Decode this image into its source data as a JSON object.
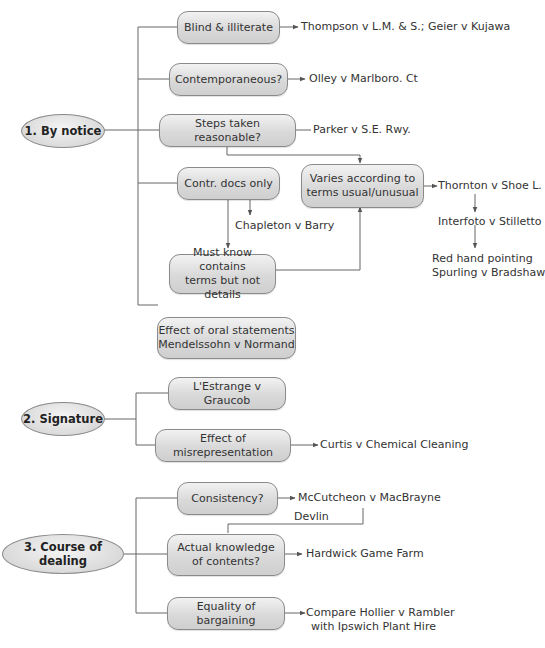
{
  "diagram": {
    "sections": [
      {
        "label": "1. By notice",
        "branches": [
          {
            "label": "Blind & illiterate",
            "case": "Thompson v L.M. & S.; Geier v Kujawa"
          },
          {
            "label": "Contemporaneous?",
            "case": "Olley v Marlboro. Ct"
          },
          {
            "label": "Steps taken reasonable?",
            "case": "Parker v S.E. Rwy."
          },
          {
            "label": "Contr. docs only",
            "case": "Chapleton v Barry"
          },
          {
            "label": "Must know contains terms but not details",
            "line1": "Must know contains",
            "line2": "terms but not details"
          },
          {
            "label": "Effect of oral statements Mendelssohn v Normand",
            "line1": "Effect of oral statements",
            "line2": "Mendelssohn v Normand"
          }
        ],
        "varies": {
          "line1": "Varies according to",
          "line2": "terms usual/unusual"
        },
        "chain": [
          {
            "label": "Thornton v Shoe L."
          },
          {
            "label": "Interfoto v Stilletto"
          },
          {
            "line1": "Red hand pointing",
            "line2": "Spurling v Bradshaw"
          }
        ]
      },
      {
        "label": "2. Signature",
        "branches": [
          {
            "label": "L'Estrange v Graucob"
          },
          {
            "label": "Effect of misrepresentation",
            "case": "Curtis v Chemical Cleaning"
          }
        ]
      },
      {
        "label": "3. Course of dealing",
        "branches": [
          {
            "label": "Consistency?",
            "case": "McCutcheon v MacBrayne"
          },
          {
            "line1": "Actual knowledge",
            "line2": "of contents?",
            "case": "Hardwick Game Farm",
            "link_label": "Devlin"
          },
          {
            "label": "Equality of bargaining",
            "case_line1": "Compare Hollier v Rambler",
            "case_line2": "with Ipswich Plant Hire"
          }
        ]
      }
    ]
  }
}
